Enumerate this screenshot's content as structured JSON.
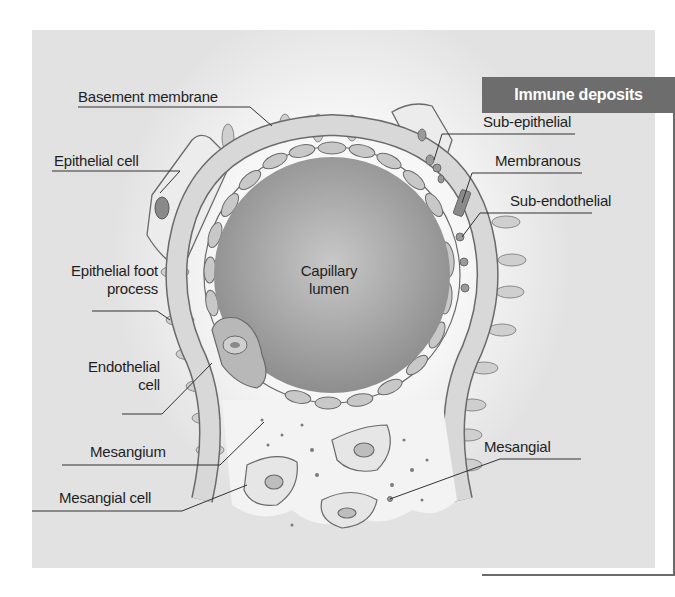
{
  "diagram": {
    "colors": {
      "background_light": "#ffffff",
      "background_dark": "#e2e2e2",
      "lumen": "#a8a8a8",
      "membrane": "#d8d8d8",
      "cell_fill": "#c4c4c4",
      "outline": "#6a6a6a",
      "header_fill": "#6d6d6d",
      "header_text": "#ffffff"
    },
    "center_label": {
      "line1": "Capillary",
      "line2": "lumen"
    },
    "left_labels": [
      {
        "id": "basement-membrane",
        "text": "Basement membrane"
      },
      {
        "id": "epithelial-cell",
        "text": "Epithelial cell"
      },
      {
        "id": "epithelial-foot-process",
        "line1": "Epithelial foot",
        "line2": "process"
      },
      {
        "id": "endothelial-cell",
        "line1": "Endothelial",
        "line2": "cell"
      },
      {
        "id": "mesangium",
        "text": "Mesangium"
      },
      {
        "id": "mesangial-cell",
        "text": "Mesangial cell"
      }
    ],
    "immune_deposits": {
      "title": "Immune deposits",
      "items": [
        {
          "id": "sub-epithelial",
          "text": "Sub-epithelial"
        },
        {
          "id": "membranous",
          "text": "Membranous"
        },
        {
          "id": "sub-endothelial",
          "text": "Sub-endothelial"
        },
        {
          "id": "mesangial",
          "text": "Mesangial"
        }
      ]
    }
  }
}
